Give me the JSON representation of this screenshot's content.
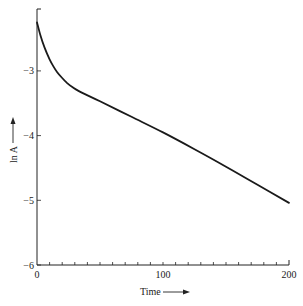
{
  "chart_data": {
    "type": "line",
    "title": "",
    "xlabel": "Time",
    "ylabel": "ln A",
    "xlim": [
      0,
      200
    ],
    "ylim": [
      -6,
      -2.05
    ],
    "x_ticks_labeled": [
      0,
      100,
      200
    ],
    "x_tick_labels": [
      "0",
      "100",
      "200"
    ],
    "x_minor_tick_step": 10,
    "y_ticks": [
      -3,
      -4,
      -5,
      -6
    ],
    "y_tick_labels": [
      "-3",
      "-4",
      "-5",
      "-6"
    ],
    "grid": false,
    "legend": null,
    "series": [
      {
        "name": "ln A",
        "x": [
          0,
          3,
          6,
          10,
          13,
          16,
          20,
          24,
          28,
          34,
          50,
          75,
          100,
          125,
          150,
          175,
          200
        ],
        "y": [
          -2.25,
          -2.47,
          -2.64,
          -2.82,
          -2.93,
          -3.02,
          -3.11,
          -3.19,
          -3.25,
          -3.32,
          -3.47,
          -3.71,
          -3.95,
          -4.21,
          -4.48,
          -4.76,
          -5.04
        ]
      }
    ],
    "annotations": [
      "Time arrow pointing right",
      "ln A arrow pointing up"
    ]
  }
}
